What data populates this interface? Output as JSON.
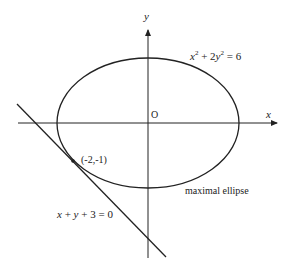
{
  "diagram": {
    "axes": {
      "x_label": "x",
      "y_label": "y",
      "origin_label": "O"
    },
    "ellipse": {
      "equation_lhs": "x",
      "equation": "x² + 2y² = 6",
      "parts": {
        "x": "x",
        "plus": " + 2",
        "y": "y",
        "rhs": " = 6",
        "exp": "2"
      },
      "caption": "maximal ellipse"
    },
    "tangent_line": {
      "equation": "x + y + 3 = 0",
      "parts": {
        "x": "x",
        "p1": " + ",
        "y": "y",
        "rest": " + 3 = 0"
      }
    },
    "tangent_point": {
      "label": "(-2,-1)",
      "coords": [
        -2,
        -1
      ]
    },
    "colors": {
      "stroke": "#222222",
      "background": "#ffffff"
    }
  }
}
